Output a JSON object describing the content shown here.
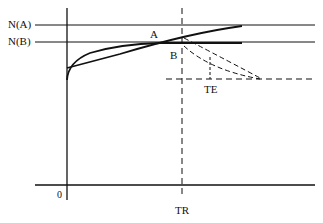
{
  "diagram": {
    "labels": {
      "na": "N(A)",
      "nb": "N(B)",
      "a": "A",
      "b": "B",
      "te": "TE",
      "tr": "TR",
      "origin": "0"
    },
    "colors": {
      "line": "#111111",
      "background": "#ffffff"
    },
    "elements": [
      "y-axis",
      "x-axis",
      "N(A) horizontal line",
      "N(B) horizontal line",
      "curve A (rising toward N(A))",
      "curve B (saturating toward N(B))",
      "TR vertical dashed line",
      "TE horizontal dashed line",
      "TE vertical dashed marker",
      "two dashed decay curves after TR"
    ]
  }
}
